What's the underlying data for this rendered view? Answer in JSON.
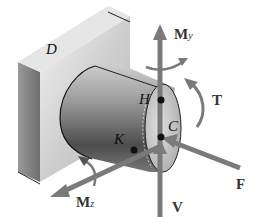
{
  "diagram": {
    "type": "mechanics-free-body",
    "points": {
      "D": "D",
      "H": "H",
      "K": "K",
      "C": "C"
    },
    "loads": {
      "My": {
        "label": "M",
        "subscript": "y"
      },
      "Mz": {
        "label": "M",
        "subscript": "z"
      },
      "T": {
        "label": "T"
      },
      "F": {
        "label": "F"
      },
      "V": {
        "label": "V"
      }
    },
    "colors": {
      "arrow": "#7a7a7a",
      "wall_front": "#c8c8c8",
      "wall_side": "#8c8c8c",
      "cylinder_dark": "#5a5a5a",
      "cylinder_light": "#d9d9d9",
      "point": "#111111"
    }
  }
}
